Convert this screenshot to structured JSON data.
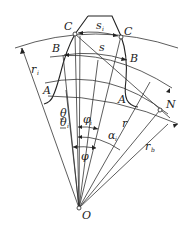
{
  "diagram": {
    "points": [
      {
        "id": "C_left",
        "label": "C",
        "x": 75,
        "y": 34
      },
      {
        "id": "C_right",
        "label": "C",
        "x": 120,
        "y": 37
      },
      {
        "id": "B_left",
        "label": "B",
        "x": 63,
        "y": 55
      },
      {
        "id": "B_right",
        "label": "B",
        "x": 128,
        "y": 60
      },
      {
        "id": "A_left",
        "label": "A",
        "x": 52,
        "y": 88
      },
      {
        "id": "A_right",
        "label": "A",
        "x": 118,
        "y": 94
      },
      {
        "id": "N",
        "label": "N",
        "x": 160,
        "y": 110
      },
      {
        "id": "O",
        "label": "O",
        "x": 79,
        "y": 208
      }
    ],
    "labels": {
      "C_left": "C",
      "C_right": "C",
      "s_i": {
        "main": "s",
        "sub": "i"
      },
      "s": "s",
      "B_left": "B",
      "B_right": "B",
      "A_left": "A",
      "A_right": "A",
      "r_i": {
        "main": "r",
        "sub": "i"
      },
      "theta": "θ",
      "theta_i": {
        "main": "θ",
        "sub": "i"
      },
      "phi_i": {
        "main": "φ",
        "sub": "i"
      },
      "alpha_i": {
        "main": "α",
        "sub": "i"
      },
      "phi": "φ",
      "r": "r",
      "r_b": {
        "main": "r",
        "sub": "b"
      },
      "N": "N",
      "O": "O"
    },
    "stroke_color": "#222222",
    "background_color": "#ffffff"
  }
}
